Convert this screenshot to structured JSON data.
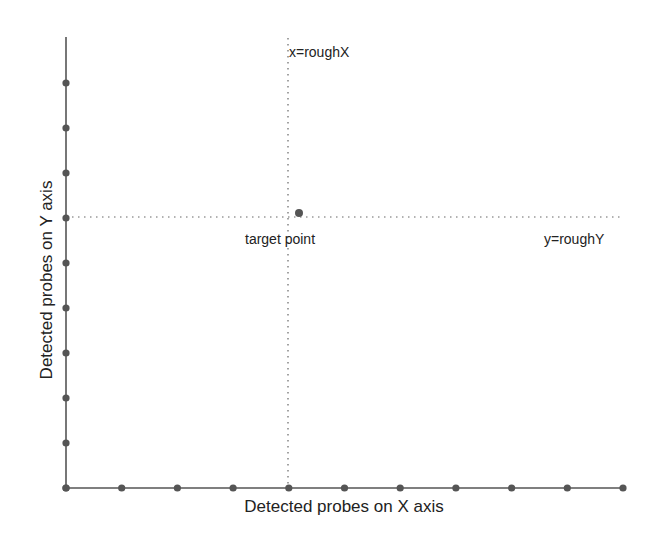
{
  "chart_data": {
    "type": "scatter",
    "title": "",
    "xlabel": "Detected probes on X axis",
    "ylabel": "Detected probes on Y axis",
    "x_probes": [
      0,
      1,
      2,
      3,
      4,
      5,
      6,
      7,
      8,
      9,
      10
    ],
    "y_probes": [
      0,
      1,
      2,
      3,
      4,
      5,
      6,
      7,
      8,
      9
    ],
    "target_point": {
      "label": "target point",
      "x": 4.2,
      "y": 6.1
    },
    "guide_lines": [
      {
        "label": "x=roughX",
        "orientation": "vertical",
        "value": 4
      },
      {
        "label": "y=roughY",
        "orientation": "horizontal",
        "value": 6
      }
    ],
    "grid": false,
    "colors": {
      "axis": "#555555",
      "dot": "#555555",
      "guide": "#666666"
    }
  },
  "labels": {
    "xlabel": "Detected probes on X axis",
    "ylabel": "Detected probes on Y axis",
    "vline": "x=roughX",
    "hline": "y=roughY",
    "target": "target point"
  }
}
